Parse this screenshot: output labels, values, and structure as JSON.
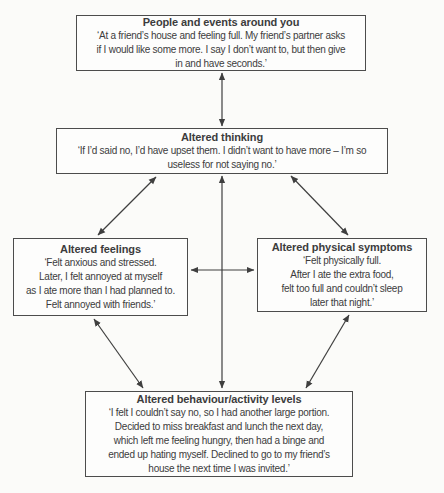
{
  "palette": {
    "page_background": "#fbfbf9",
    "box_background": "#fdfdfc",
    "border": "#4c4c4c",
    "ink": "#3c3c3c",
    "arrow": "#3f3f3f"
  },
  "diagram": {
    "boxes": [
      {
        "id": "events",
        "title": "People and events around you",
        "lines": [
          "‘At a friend’s house and feeling full. My friend’s partner asks",
          "if I would like some more. I say I don’t want to, but then give",
          "in and have seconds.’"
        ]
      },
      {
        "id": "thinking",
        "title": "Altered thinking",
        "lines": [
          "‘If I’d said no, I’d have upset them. I didn’t want to have more – I’m so",
          "useless for not saying no.’"
        ]
      },
      {
        "id": "feelings",
        "title": "Altered feelings",
        "lines": [
          "‘Felt anxious and stressed.",
          "Later, I felt annoyed at myself",
          "as I ate more than I had planned to.",
          "Felt annoyed with friends.’"
        ]
      },
      {
        "id": "symptoms",
        "title": "Altered physical symptoms",
        "lines": [
          "‘Felt physically full.",
          "After I ate the extra food,",
          "felt too full and couldn’t sleep",
          "later that night.’"
        ]
      },
      {
        "id": "behaviour",
        "title": "Altered behaviour/activity levels",
        "lines": [
          "‘I felt I couldn’t say no, so I had another large portion.",
          "Decided to miss breakfast and lunch the next day,",
          "which left me feeling hungry, then had a binge and",
          "ended up hating myself. Declined to go to my friend’s",
          "house the next time I was invited.’"
        ]
      }
    ],
    "arrows": [
      {
        "id": "events-thinking",
        "from": "events",
        "to": "thinking",
        "bidirectional": true,
        "x1": 222,
        "y1": 73,
        "x2": 222,
        "y2": 126
      },
      {
        "id": "thinking-behaviour",
        "from": "thinking",
        "to": "behaviour",
        "bidirectional": true,
        "x1": 222,
        "y1": 176,
        "x2": 222,
        "y2": 388
      },
      {
        "id": "thinking-feelings",
        "from": "thinking",
        "to": "feelings",
        "bidirectional": true,
        "x1": 156,
        "y1": 177,
        "x2": 98,
        "y2": 235
      },
      {
        "id": "thinking-symptoms",
        "from": "thinking",
        "to": "symptoms",
        "bidirectional": true,
        "x1": 291,
        "y1": 176,
        "x2": 348,
        "y2": 235
      },
      {
        "id": "feelings-symptoms",
        "from": "feelings",
        "to": "symptoms",
        "bidirectional": true,
        "x1": 191,
        "y1": 270,
        "x2": 254,
        "y2": 270
      },
      {
        "id": "feelings-behaviour",
        "from": "feelings",
        "to": "behaviour",
        "bidirectional": true,
        "x1": 94,
        "y1": 319,
        "x2": 143,
        "y2": 388
      },
      {
        "id": "symptoms-behaviour",
        "from": "symptoms",
        "to": "behaviour",
        "bidirectional": true,
        "x1": 349,
        "y1": 315,
        "x2": 306,
        "y2": 388
      }
    ]
  }
}
